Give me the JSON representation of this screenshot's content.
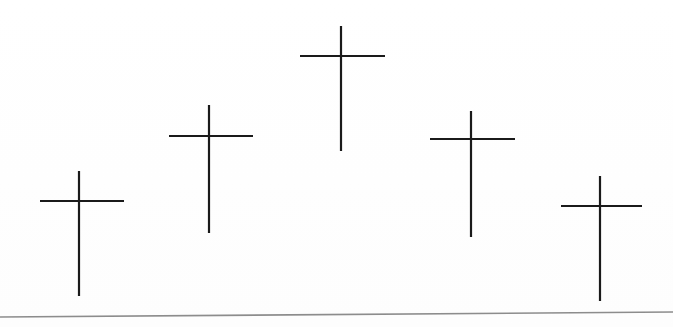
{
  "document": {
    "kind": "scanned-line-drawing",
    "title": "Five Crosses",
    "description": "Five hand-drawn Latin crosses arranged in an arc, tallest at center, above a slanted horizontal rule",
    "width": 673,
    "height": 327,
    "background_color": "#ffffff",
    "ink_color": "#1a1a1a",
    "rule_color": "#8c8c8c"
  },
  "artwork": {
    "name": "five-crosses-arc",
    "stroke_color": "#1a1a1a",
    "stroke_width": 2.2,
    "crosses": [
      {
        "label": "cross-1-far-left",
        "order": 1,
        "post_x": 79,
        "post_top_y": 171,
        "post_bottom_y": 296,
        "arm_y": 201,
        "arm_left_x": 40,
        "arm_right_x": 124,
        "post_height": 125,
        "arm_width": 84
      },
      {
        "label": "cross-2-left",
        "order": 2,
        "post_x": 209,
        "post_top_y": 105,
        "post_bottom_y": 233,
        "arm_y": 136,
        "arm_left_x": 169,
        "arm_right_x": 253,
        "post_height": 128,
        "arm_width": 84
      },
      {
        "label": "cross-3-center-tallest",
        "order": 3,
        "post_x": 341,
        "post_top_y": 26,
        "post_bottom_y": 151,
        "arm_y": 56,
        "arm_left_x": 300,
        "arm_right_x": 385,
        "post_height": 125,
        "arm_width": 85
      },
      {
        "label": "cross-4-right",
        "order": 4,
        "post_x": 471,
        "post_top_y": 111,
        "post_bottom_y": 237,
        "arm_y": 139,
        "arm_left_x": 430,
        "arm_right_x": 515,
        "post_height": 126,
        "arm_width": 85
      },
      {
        "label": "cross-5-far-right",
        "order": 5,
        "post_x": 600,
        "post_top_y": 176,
        "post_bottom_y": 301,
        "arm_y": 206,
        "arm_left_x": 561,
        "arm_right_x": 642,
        "post_height": 125,
        "arm_width": 81
      }
    ],
    "baseline_rule": {
      "label": "bottom-horizontal-rule",
      "start_x": 0,
      "start_y": 317,
      "end_x": 673,
      "end_y": 312,
      "stroke_color": "#8c8c8c",
      "stroke_width": 1.6,
      "slant": "slightly rising to the right"
    }
  }
}
